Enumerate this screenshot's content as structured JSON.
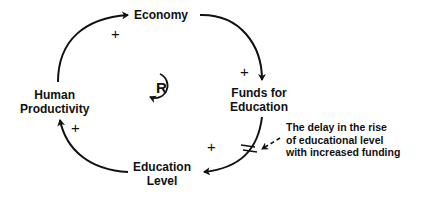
{
  "diagram": {
    "type": "causal-loop",
    "nodes": {
      "economy": {
        "label": "Economy"
      },
      "funds": {
        "line1": "Funds for",
        "line2": "Education"
      },
      "education_level": {
        "line1": "Education",
        "line2": "Level"
      },
      "productivity": {
        "line1": "Human",
        "line2": "Productivity"
      }
    },
    "links": [
      {
        "from": "Human Productivity",
        "to": "Economy",
        "polarity": "+"
      },
      {
        "from": "Economy",
        "to": "Funds for Education",
        "polarity": "+"
      },
      {
        "from": "Funds for Education",
        "to": "Education Level",
        "polarity": "+",
        "delay": true
      },
      {
        "from": "Education Level",
        "to": "Human Productivity",
        "polarity": "+"
      }
    ],
    "signs": {
      "s1": "+",
      "s2": "+",
      "s3": "+",
      "s4": "+"
    },
    "loop": {
      "label": "R",
      "type": "reinforcing"
    },
    "annotation": {
      "line1": "The delay in the rise",
      "line2": "of educational level",
      "line3": "with increased funding"
    },
    "colors": {
      "line": "#111111",
      "background": "#ffffff"
    }
  }
}
